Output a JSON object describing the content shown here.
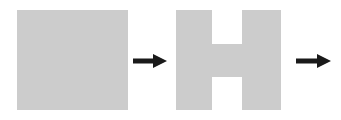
{
  "diagram": {
    "background_color": "#ffffff",
    "shape_fill_color": "#cccccc",
    "arrow_color": "#1a1a1a",
    "steps": [
      {
        "index": 1,
        "name": "square",
        "label": "Square",
        "description": "Solid filled square",
        "fill": "#cccccc",
        "x": 17,
        "y": 10,
        "width": 111,
        "height": 100
      },
      {
        "index": 2,
        "name": "h-shape",
        "label": "H shape",
        "description": "Square with a top notch and a bottom notch cut out forming a capital H",
        "fill": "#cccccc",
        "x": 176,
        "y": 10,
        "width": 105,
        "height": 100,
        "notch_left": 36,
        "notch_right": 66,
        "top_notch_depth": 34,
        "bottom_notch_depth": 33
      }
    ],
    "arrows": [
      {
        "index": 1,
        "name": "arrow-1",
        "direction": "right",
        "label": "",
        "color": "#1a1a1a",
        "x": 133,
        "y": 50,
        "width": 34
      },
      {
        "index": 2,
        "name": "arrow-2",
        "direction": "right",
        "label": "",
        "color": "#1a1a1a",
        "x": 296,
        "y": 50,
        "width": 45
      }
    ]
  }
}
